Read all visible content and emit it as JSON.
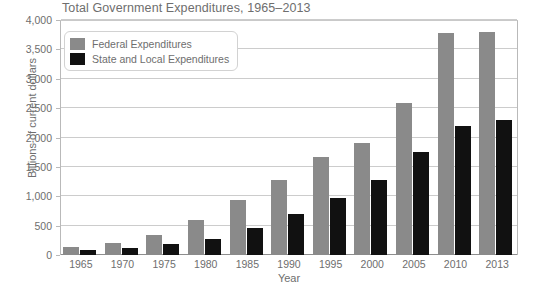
{
  "chart_data": {
    "type": "bar",
    "title": "Total Government Expenditures, 1965–2013",
    "xlabel": "Year",
    "ylabel": "Billions of current dollars",
    "categories": [
      "1965",
      "1970",
      "1975",
      "1980",
      "1985",
      "1990",
      "1995",
      "2000",
      "2005",
      "2010",
      "2013"
    ],
    "series": [
      {
        "name": "Federal Expenditures",
        "color": "#8a8a8a",
        "values": [
          135,
          210,
          340,
          600,
          940,
          1280,
          1660,
          1910,
          2590,
          3780,
          3790
        ]
      },
      {
        "name": "State and Local Expenditures",
        "color": "#111111",
        "values": [
          85,
          120,
          180,
          270,
          460,
          690,
          970,
          1280,
          1760,
          2200,
          2300
        ]
      }
    ],
    "ylim": [
      0,
      4000
    ],
    "yticks": [
      0,
      500,
      1000,
      1500,
      2000,
      2500,
      3000,
      3500,
      4000
    ],
    "ytick_labels": [
      "0",
      "500",
      "1,000",
      "1,500",
      "2,000",
      "2,500",
      "3,000",
      "3,500",
      "4,000"
    ],
    "grid": true,
    "legend_position": "top-left"
  }
}
